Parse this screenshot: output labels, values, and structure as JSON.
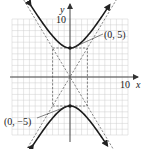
{
  "chart_data": {
    "type": "line",
    "title": "",
    "xlabel": "x",
    "ylabel": "y",
    "xlim": [
      -10,
      10
    ],
    "ylim": [
      -10,
      10
    ],
    "grid": true,
    "tick_labels": {
      "x": "10",
      "y": "10"
    },
    "equation": "y^2/25 - x^2/9 = 1",
    "series": [
      {
        "name": "hyperbola-upper-branch",
        "style": "solid-bold",
        "x": [
          -9,
          -7,
          -5,
          -3,
          -1,
          0,
          1,
          3,
          5,
          7,
          9
        ],
        "y": [
          15.81,
          12.69,
          9.72,
          7.07,
          5.27,
          5,
          5.27,
          7.07,
          9.72,
          12.69,
          15.81
        ]
      },
      {
        "name": "hyperbola-lower-branch",
        "style": "solid-bold",
        "x": [
          -9,
          -7,
          -5,
          -3,
          -1,
          0,
          1,
          3,
          5,
          7,
          9
        ],
        "y": [
          -15.81,
          -12.69,
          -9.72,
          -7.07,
          -5.27,
          -5,
          -5.27,
          -7.07,
          -9.72,
          -12.69,
          -15.81
        ]
      },
      {
        "name": "asymptote-positive",
        "style": "dashed",
        "x": [
          -10,
          10
        ],
        "y": [
          -16.67,
          16.67
        ]
      },
      {
        "name": "asymptote-negative",
        "style": "dashed",
        "x": [
          -10,
          10
        ],
        "y": [
          16.67,
          -16.67
        ]
      },
      {
        "name": "fundamental-rectangle",
        "style": "dashed",
        "x": [
          -3,
          3,
          3,
          -3,
          -3
        ],
        "y": [
          5,
          5,
          -5,
          -5,
          5
        ]
      }
    ],
    "points": [
      {
        "x": 0,
        "y": 5,
        "label": "(0, 5)"
      },
      {
        "x": 0,
        "y": -5,
        "label": "(0, −5)"
      }
    ],
    "annotations": [
      {
        "text": "(0, 5)",
        "points_to": [
          0,
          5
        ]
      },
      {
        "text": "(0, −5)",
        "points_to": [
          0,
          -5
        ]
      }
    ]
  },
  "labels": {
    "x_axis": "x",
    "y_axis": "y",
    "x_tick": "10",
    "y_tick": "10",
    "vertex_top": "(0, 5)",
    "vertex_bottom": "(0, −5)"
  }
}
